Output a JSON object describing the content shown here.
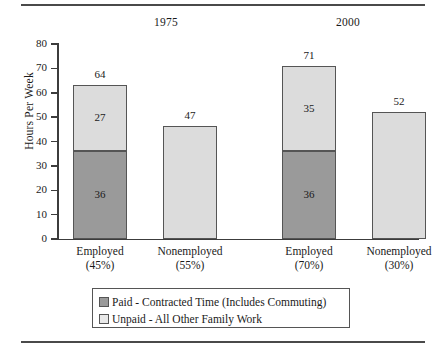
{
  "chart_data": {
    "type": "bar",
    "title": "",
    "subtitle": "",
    "xlabel": "",
    "ylabel": "Hours Per Week",
    "ylim": [
      0,
      80
    ],
    "yticks": [
      0,
      10,
      20,
      30,
      40,
      50,
      60,
      70,
      80
    ],
    "grid": false,
    "stacked": true,
    "legend_position": "bottom",
    "group_titles": [
      "1975",
      "2000"
    ],
    "categories": [
      "Employed\n(45%)",
      "Nonemployed\n(55%)",
      "Employed\n(70%)",
      "Nonemployed\n(30%)"
    ],
    "series": [
      {
        "name": "Paid - Contracted Time (Includes Commuting)",
        "color": "#9a9a9a",
        "values": [
          36,
          0,
          36,
          0
        ]
      },
      {
        "name": "Unpaid - All Other Family Work",
        "color": "#dcdcdc",
        "values": [
          27,
          47,
          35,
          52
        ]
      }
    ],
    "totals": [
      64,
      47,
      71,
      52
    ],
    "bars": [
      {
        "group": "1975",
        "category": "Employed",
        "percent": "(45%)",
        "total": "64",
        "paid": "36",
        "unpaid": "27",
        "paid_value": 36,
        "unpaid_value": 27,
        "total_value": 63,
        "show_paid_label": true,
        "show_unpaid_label": true
      },
      {
        "group": "1975",
        "category": "Nonemployed",
        "percent": "(55%)",
        "total": "47",
        "paid": "",
        "unpaid": "",
        "paid_value": 0,
        "unpaid_value": 46.5,
        "total_value": 46.5,
        "show_paid_label": false,
        "show_unpaid_label": false
      },
      {
        "group": "2000",
        "category": "Employed",
        "percent": "(70%)",
        "total": "71",
        "paid": "36",
        "unpaid": "35",
        "paid_value": 36,
        "unpaid_value": 35,
        "total_value": 71,
        "show_paid_label": true,
        "show_unpaid_label": true
      },
      {
        "group": "2000",
        "category": "Nonemployed",
        "percent": "(30%)",
        "total": "52",
        "paid": "",
        "unpaid": "",
        "paid_value": 0,
        "unpaid_value": 52,
        "total_value": 52,
        "show_paid_label": false,
        "show_unpaid_label": false
      }
    ],
    "legend": [
      {
        "label": "Paid - Contracted Time (Includes Commuting)",
        "swatch": "paid"
      },
      {
        "label": "Unpaid - All Other Family Work",
        "swatch": "unpaid"
      }
    ],
    "colors": {
      "paid": "#9a9a9a",
      "unpaid": "#dcdcdc",
      "axis": "#3c3c3c",
      "rule": "#4a4a4a",
      "text": "#1a1a1a",
      "background": "#ffffff"
    }
  },
  "axis": {
    "y_label": "Hours Per Week",
    "y_ticks": [
      "0",
      "10",
      "20",
      "30",
      "40",
      "50",
      "60",
      "70",
      "80"
    ]
  },
  "groups": [
    {
      "title": "1975"
    },
    {
      "title": "2000"
    }
  ]
}
